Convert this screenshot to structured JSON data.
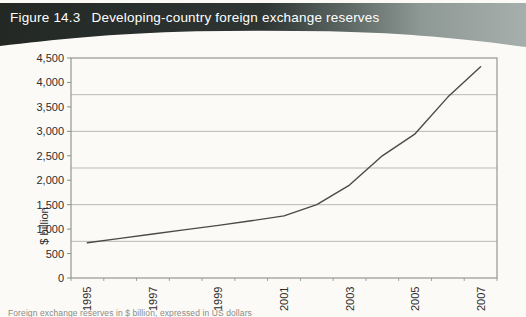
{
  "header": {
    "figure_label": "Figure 14.3",
    "title": "Developing-country foreign exchange reserves"
  },
  "chart_data": {
    "type": "line",
    "title": "Developing-country foreign exchange reserves",
    "x": [
      1995,
      1996,
      1997,
      1998,
      1999,
      2000,
      2001,
      2002,
      2003,
      2004,
      2005,
      2006,
      2007
    ],
    "values": [
      720,
      810,
      900,
      990,
      1075,
      1170,
      1270,
      1500,
      1900,
      2500,
      2950,
      3700,
      4320
    ],
    "series_name": "Developing-country foreign exchange reserves",
    "xlabel": "",
    "ylabel": "$ billion",
    "ylim": [
      0,
      4500
    ],
    "y_tick_interval": 500,
    "y_tick_labels": [
      "0",
      "500",
      "1,000",
      "1,500",
      "2,000",
      "2,500",
      "3,000",
      "3,500",
      "4,000",
      "4,500"
    ],
    "x_tick_labels": [
      "1995",
      "1997",
      "1999",
      "2001",
      "2003",
      "2005",
      "2007"
    ],
    "gridline_values": [
      750,
      1500,
      2250,
      3000,
      3750
    ],
    "grid": "horizontal",
    "legend": "none"
  },
  "footer": {
    "note": "Foreign exchange reserves in $ billion, expressed in US dollars"
  },
  "colors": {
    "banner_dark": "#242926",
    "banner_mid": "#5d6865",
    "banner_light": "#a6afac",
    "banner_text": "#ffffff",
    "plot_border": "#8c8c8c",
    "gridline": "#b7b7b3",
    "line": "#4a4a4a",
    "tick_text": "#2e2d2b"
  }
}
